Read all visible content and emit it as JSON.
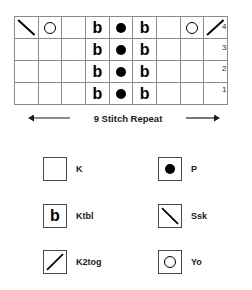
{
  "chart_data": {
    "type": "table",
    "columns": 9,
    "rows": 4,
    "row_labels": [
      "4",
      "3",
      "2",
      "1"
    ],
    "row_label_order": "top-to-bottom",
    "legend_position": "below",
    "grid": true,
    "cells": [
      [
        "ssk",
        "yo",
        "blank",
        "ktbl",
        "p",
        "ktbl",
        "blank",
        "yo",
        "k2tog"
      ],
      [
        "blank",
        "blank",
        "blank",
        "ktbl",
        "p",
        "ktbl",
        "blank",
        "blank",
        "blank"
      ],
      [
        "blank",
        "blank",
        "blank",
        "ktbl",
        "p",
        "ktbl",
        "blank",
        "blank",
        "blank"
      ],
      [
        "blank",
        "blank",
        "blank",
        "ktbl",
        "p",
        "ktbl",
        "blank",
        "blank",
        "blank"
      ]
    ],
    "symbol_glyphs": {
      "blank": "",
      "ktbl": "b",
      "p": "●",
      "yo": "○",
      "ssk": "\\",
      "k2tog": "/"
    }
  },
  "chart": {
    "row_numbers": [
      "4",
      "3",
      "2",
      "1"
    ]
  },
  "repeat": {
    "label": "9 Stitch Repeat"
  },
  "legend": {
    "items": [
      {
        "symbol": "blank",
        "label": "K"
      },
      {
        "symbol": "p",
        "label": "P"
      },
      {
        "symbol": "ktbl",
        "label": "Ktbl"
      },
      {
        "symbol": "ssk",
        "label": "Ssk"
      },
      {
        "symbol": "k2tog",
        "label": "K2tog"
      },
      {
        "symbol": "yo",
        "label": "Yo"
      }
    ]
  },
  "colors": {
    "grid_line": "#8a8a8a",
    "grid_border": "#555555",
    "symbol": "#000000",
    "text": "#1b1b1b",
    "background": "#ffffff"
  }
}
